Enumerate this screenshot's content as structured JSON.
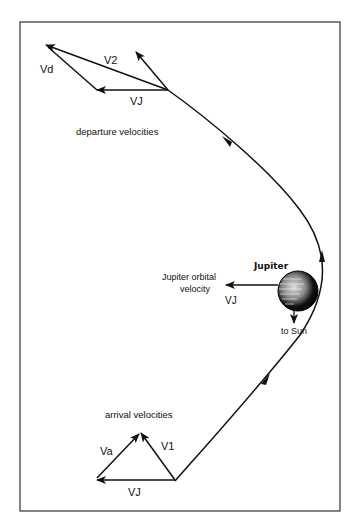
{
  "diagram": {
    "departure": {
      "caption": "departure velocities",
      "vector_labels": {
        "v2": "V2",
        "vd": "Vd",
        "vj": "VJ"
      }
    },
    "arrival": {
      "caption": "arrival velocities",
      "vector_labels": {
        "va": "Va",
        "v1": "V1",
        "vj": "VJ"
      }
    },
    "planet": {
      "name": "Jupiter",
      "orbital_velocity_label_line1": "Jupiter orbital",
      "orbital_velocity_label_line2": "velocity",
      "vj_label": "VJ",
      "sun_direction_label": "to Sun"
    },
    "colors": {
      "ink": "#111111",
      "background": "#ffffff",
      "frame": "#333333"
    }
  }
}
